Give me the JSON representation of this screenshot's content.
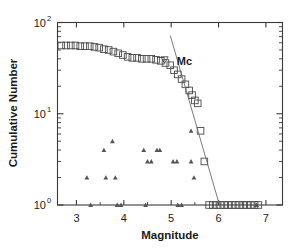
{
  "chart_data": {
    "type": "scatter",
    "title": "",
    "xlabel": "Magnitude",
    "ylabel": "Cumulative Number",
    "xlim": [
      2.6,
      7.35
    ],
    "ylim": [
      1,
      100
    ],
    "yscale": "log",
    "xscale": "linear",
    "grid": false,
    "legend_position": "none",
    "xticks": [
      3,
      4,
      5,
      6,
      7
    ],
    "xtick_labels": [
      "3",
      "4",
      "5",
      "6",
      "7"
    ],
    "yticks": [
      1,
      10,
      100
    ],
    "ytick_labels": [
      "10⁰",
      "10¹",
      "10²"
    ],
    "ytick_label_parts": [
      {
        "base": "10",
        "exp": "0"
      },
      {
        "base": "10",
        "exp": "1"
      },
      {
        "base": "10",
        "exp": "2"
      }
    ],
    "series": [
      {
        "name": "Cumulative number (open squares)",
        "marker": "open-square",
        "points": [
          {
            "x": 2.68,
            "y": 56
          },
          {
            "x": 2.78,
            "y": 56
          },
          {
            "x": 2.88,
            "y": 56
          },
          {
            "x": 2.98,
            "y": 56
          },
          {
            "x": 3.08,
            "y": 55
          },
          {
            "x": 3.18,
            "y": 55
          },
          {
            "x": 3.28,
            "y": 55
          },
          {
            "x": 3.38,
            "y": 54
          },
          {
            "x": 3.48,
            "y": 53
          },
          {
            "x": 3.58,
            "y": 51
          },
          {
            "x": 3.68,
            "y": 50
          },
          {
            "x": 3.78,
            "y": 48
          },
          {
            "x": 3.88,
            "y": 46
          },
          {
            "x": 3.98,
            "y": 44
          },
          {
            "x": 4.08,
            "y": 42
          },
          {
            "x": 4.18,
            "y": 41
          },
          {
            "x": 4.28,
            "y": 41
          },
          {
            "x": 4.38,
            "y": 40
          },
          {
            "x": 4.48,
            "y": 40
          },
          {
            "x": 4.58,
            "y": 40
          },
          {
            "x": 4.68,
            "y": 39
          },
          {
            "x": 4.78,
            "y": 38
          },
          {
            "x": 4.88,
            "y": 36
          },
          {
            "x": 4.98,
            "y": 34
          },
          {
            "x": 5.06,
            "y": 30
          },
          {
            "x": 5.14,
            "y": 27
          },
          {
            "x": 5.22,
            "y": 24
          },
          {
            "x": 5.3,
            "y": 21
          },
          {
            "x": 5.38,
            "y": 18
          },
          {
            "x": 5.44,
            "y": 16
          },
          {
            "x": 5.5,
            "y": 14
          },
          {
            "x": 5.56,
            "y": 13
          },
          {
            "x": 5.62,
            "y": 6.5
          },
          {
            "x": 5.7,
            "y": 3.0
          },
          {
            "x": 5.8,
            "y": 1
          },
          {
            "x": 5.88,
            "y": 1
          },
          {
            "x": 5.96,
            "y": 1
          },
          {
            "x": 6.04,
            "y": 1
          },
          {
            "x": 6.12,
            "y": 1
          },
          {
            "x": 6.2,
            "y": 1
          },
          {
            "x": 6.28,
            "y": 1
          },
          {
            "x": 6.36,
            "y": 1
          },
          {
            "x": 6.44,
            "y": 1
          },
          {
            "x": 6.52,
            "y": 1
          },
          {
            "x": 6.6,
            "y": 1
          },
          {
            "x": 6.68,
            "y": 1
          },
          {
            "x": 6.76,
            "y": 1
          },
          {
            "x": 6.84,
            "y": 1
          }
        ]
      },
      {
        "name": "Discrete number (filled triangles)",
        "marker": "filled-triangle-up",
        "points": [
          {
            "x": 3.22,
            "y": 2
          },
          {
            "x": 3.3,
            "y": 1
          },
          {
            "x": 3.58,
            "y": 4
          },
          {
            "x": 3.62,
            "y": 2
          },
          {
            "x": 3.76,
            "y": 5
          },
          {
            "x": 3.82,
            "y": 2
          },
          {
            "x": 3.86,
            "y": 1
          },
          {
            "x": 3.94,
            "y": 1
          },
          {
            "x": 4.42,
            "y": 4
          },
          {
            "x": 4.46,
            "y": 1
          },
          {
            "x": 4.5,
            "y": 3
          },
          {
            "x": 4.58,
            "y": 3
          },
          {
            "x": 4.7,
            "y": 4
          },
          {
            "x": 4.76,
            "y": 4
          },
          {
            "x": 5.04,
            "y": 3
          },
          {
            "x": 5.12,
            "y": 3
          },
          {
            "x": 5.14,
            "y": 1
          },
          {
            "x": 5.22,
            "y": 1
          },
          {
            "x": 5.42,
            "y": 6.5
          },
          {
            "x": 5.42,
            "y": 3
          },
          {
            "x": 5.48,
            "y": 2
          },
          {
            "x": 6.8,
            "y": 1
          }
        ]
      },
      {
        "name": "Completeness marker (open down triangle)",
        "marker": "open-triangle-down",
        "points": [
          {
            "x": 4.86,
            "y": 39
          }
        ]
      }
    ],
    "annotations": [
      {
        "text": "Mc",
        "x": 5.12,
        "y": 38,
        "label": "magnitude of completeness"
      }
    ],
    "lines": [
      {
        "name": "Gutenberg-Richter fit line",
        "x0": 4.98,
        "y0": 72,
        "x1": 6.02,
        "y1": 1.0
      }
    ]
  },
  "colors": {
    "background": "#ffffff",
    "axis": "#3a3a3a",
    "marker_square": "#4a4a4a",
    "marker_triangle": "#555555",
    "trend_line": "#6a6a6a",
    "text": "#1b1b1b"
  }
}
